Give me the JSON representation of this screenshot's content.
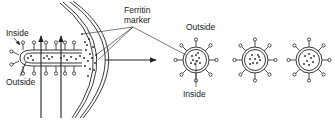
{
  "diagram": {
    "stroke_color": "#222222",
    "background": "#ffffff",
    "left_panel": {
      "labels": {
        "inside": "Inside",
        "outside": "Outside"
      },
      "marker_label_line1": "Ferritin",
      "marker_label_line2": "marker"
    },
    "right_panel": {
      "labels": {
        "outside": "Outside",
        "inside": "Inside"
      },
      "vesicle_count": 3
    }
  }
}
